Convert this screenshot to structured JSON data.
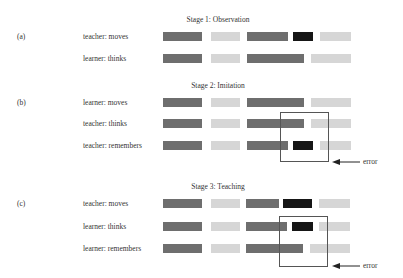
{
  "colors": {
    "dark": "#6e6e6e",
    "light": "#d6d6d6",
    "black": "#161616",
    "box": "#555555",
    "text": "#333333"
  },
  "stages": [
    {
      "title": "Stage 1: Observation",
      "label": "(a)",
      "title_y": 15,
      "rows": [
        {
          "name": "teacher: moves",
          "y": 32,
          "segments": [
            {
              "x": 163,
              "w": 39,
              "tone": "dark"
            },
            {
              "x": 211,
              "w": 29,
              "tone": "light"
            },
            {
              "x": 247,
              "w": 41,
              "tone": "dark"
            },
            {
              "x": 293,
              "w": 20,
              "tone": "black"
            },
            {
              "x": 320,
              "w": 31,
              "tone": "light"
            }
          ]
        },
        {
          "name": "learner: thinks",
          "y": 54,
          "segments": [
            {
              "x": 163,
              "w": 39,
              "tone": "dark"
            },
            {
              "x": 211,
              "w": 29,
              "tone": "light"
            },
            {
              "x": 247,
              "w": 57,
              "tone": "dark"
            },
            {
              "x": 311,
              "w": 40,
              "tone": "light"
            }
          ]
        }
      ]
    },
    {
      "title": "Stage 2: Imitation",
      "label": "(b)",
      "title_y": 81,
      "rows": [
        {
          "name": "learner: moves",
          "y": 98,
          "segments": [
            {
              "x": 163,
              "w": 39,
              "tone": "dark"
            },
            {
              "x": 211,
              "w": 29,
              "tone": "light"
            },
            {
              "x": 247,
              "w": 57,
              "tone": "dark"
            },
            {
              "x": 311,
              "w": 40,
              "tone": "light"
            }
          ]
        },
        {
          "name": "teacher: thinks",
          "y": 119,
          "segments": [
            {
              "x": 163,
              "w": 39,
              "tone": "dark"
            },
            {
              "x": 211,
              "w": 29,
              "tone": "light"
            },
            {
              "x": 247,
              "w": 57,
              "tone": "dark"
            },
            {
              "x": 311,
              "w": 40,
              "tone": "light"
            }
          ]
        },
        {
          "name": "teacher: remembers",
          "y": 141,
          "segments": [
            {
              "x": 163,
              "w": 39,
              "tone": "dark"
            },
            {
              "x": 211,
              "w": 29,
              "tone": "light"
            },
            {
              "x": 247,
              "w": 41,
              "tone": "dark"
            },
            {
              "x": 293,
              "w": 20,
              "tone": "black"
            },
            {
              "x": 320,
              "w": 31,
              "tone": "light"
            }
          ]
        }
      ],
      "box": {
        "x": 280,
        "y": 112,
        "w": 49,
        "h": 50
      },
      "error": {
        "label": "error",
        "arrow_x": 332,
        "arrow_y": 162,
        "arrow_len": 28,
        "text_x": 363
      }
    },
    {
      "title": "Stage 3: Teaching",
      "label": "(c)",
      "title_y": 182,
      "rows": [
        {
          "name": "teacher: moves",
          "y": 199,
          "segments": [
            {
              "x": 163,
              "w": 39,
              "tone": "dark"
            },
            {
              "x": 211,
              "w": 29,
              "tone": "light"
            },
            {
              "x": 246,
              "w": 33,
              "tone": "dark"
            },
            {
              "x": 283,
              "w": 29,
              "tone": "black"
            },
            {
              "x": 319,
              "w": 31,
              "tone": "light"
            }
          ]
        },
        {
          "name": "learner: thinks",
          "y": 222,
          "segments": [
            {
              "x": 163,
              "w": 39,
              "tone": "dark"
            },
            {
              "x": 211,
              "w": 29,
              "tone": "light"
            },
            {
              "x": 246,
              "w": 41,
              "tone": "dark"
            },
            {
              "x": 292,
              "w": 21,
              "tone": "black"
            },
            {
              "x": 319,
              "w": 31,
              "tone": "light"
            }
          ]
        },
        {
          "name": "learner: remembers",
          "y": 244,
          "segments": [
            {
              "x": 163,
              "w": 39,
              "tone": "dark"
            },
            {
              "x": 211,
              "w": 29,
              "tone": "light"
            },
            {
              "x": 246,
              "w": 57,
              "tone": "dark"
            },
            {
              "x": 310,
              "w": 40,
              "tone": "light"
            }
          ]
        }
      ],
      "box": {
        "x": 279,
        "y": 216,
        "w": 49,
        "h": 51
      },
      "error": {
        "label": "error",
        "arrow_x": 332,
        "arrow_y": 266,
        "arrow_len": 28,
        "text_x": 363
      }
    }
  ]
}
